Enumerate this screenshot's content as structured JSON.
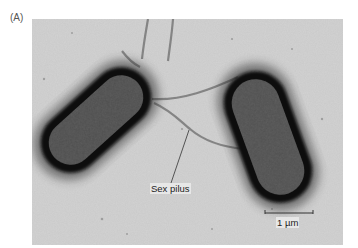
{
  "figure": {
    "panel_label": "(A)",
    "annotations": {
      "pilus_label": "Sex pilus",
      "scale_bar_label": "1 µm"
    },
    "subjects": [
      "bacterial-cell-left",
      "bacterial-cell-right",
      "sex-pilus"
    ],
    "colors": {
      "background": "#c8c8c8",
      "cell_halo": "#111111",
      "cell_body": "#4a4a4a",
      "label_text": "#222222"
    }
  }
}
